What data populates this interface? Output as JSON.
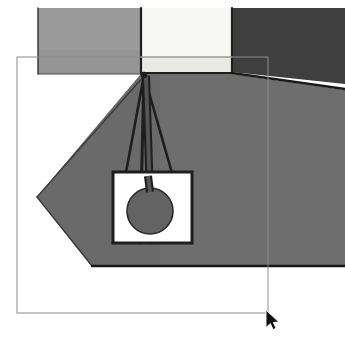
{
  "canvas": {
    "width": 345,
    "height": 338,
    "background": "#ffffff",
    "title": "Pendant lamp photo with rectangular selection"
  },
  "palette": {
    "white": "#ffffff",
    "bright_panel": "#f6f6f4",
    "bright_panel_lower": "#e9e9e6",
    "wall_left": "#9a9a9a",
    "wall_right_dark": "#3f3f3f",
    "ceiling_main": "#6e6e6e",
    "ceiling_shade": "#666666",
    "outline_dark": "#1e1e1e",
    "lamp_disc": "#636363",
    "lamp_disc_edge": "#2a2a2a",
    "selection_stroke": "#8c8c8c",
    "cursor_fill": "#101010",
    "cursor_stroke": "#ffffff"
  },
  "scene": {
    "name": "pendant-lamp-photo",
    "regions": [
      {
        "name": "wall-panel-left",
        "role": "left light-gray wall panel",
        "fill": "#9a9a9a",
        "points": "38,8 141,8 141,74 38,74"
      },
      {
        "name": "wall-panel-left-lower",
        "role": "left wall panel lower band",
        "fill": "#959595",
        "points": "38,50 141,50 141,74 38,74"
      },
      {
        "name": "bright-window-panel",
        "role": "bright white center panel",
        "fill": "#f6f6f4",
        "points": "141,8 232,8 232,57 141,57"
      },
      {
        "name": "bright-window-panel-lower",
        "role": "bright center panel lower strip",
        "fill": "#e9e9e6",
        "points": "141,57 232,57 232,72 141,72"
      },
      {
        "name": "wall-panel-right-dark",
        "role": "right dark wall panel",
        "fill": "#3f3f3f",
        "points": "232,8 345,8 345,84 232,72"
      },
      {
        "name": "ceiling-plane",
        "role": "large mid-gray ceiling plane",
        "fill": "#6e6e6e",
        "points": "141,74 232,74 345,90 345,266 92,266 37,197 141,74"
      },
      {
        "name": "ceiling-left-facet",
        "role": "darker left facet of ceiling",
        "fill": "#6a6a6a",
        "points": "141,74 37,197 92,266 160,266 160,74"
      }
    ],
    "edges": [
      {
        "name": "edge-panel-left-vertical",
        "from": [
          38,
          8
        ],
        "to": [
          38,
          74
        ],
        "stroke": "#2f2f2f",
        "width": 1.4
      },
      {
        "name": "edge-bright-panel-left",
        "from": [
          141,
          8
        ],
        "to": [
          141,
          74
        ],
        "stroke": "#1e1e1e",
        "width": 2.2
      },
      {
        "name": "edge-bright-panel-right",
        "from": [
          232,
          8
        ],
        "to": [
          232,
          73
        ],
        "stroke": "#1e1e1e",
        "width": 2.2
      },
      {
        "name": "edge-bright-panel-bottom",
        "from": [
          141,
          73
        ],
        "to": [
          232,
          73
        ],
        "stroke": "#1e1e1e",
        "width": 2.0
      },
      {
        "name": "edge-bright-panel-midline",
        "from": [
          141,
          57
        ],
        "to": [
          232,
          57
        ],
        "stroke": "#b9b9b5",
        "width": 1.0
      },
      {
        "name": "edge-left-wall-base",
        "from": [
          38,
          74
        ],
        "to": [
          141,
          74
        ],
        "stroke": "#4a4a4a",
        "width": 1.2
      },
      {
        "name": "edge-right-wall-base",
        "from": [
          232,
          73
        ],
        "to": [
          345,
          89
        ],
        "stroke": "#1a1a1a",
        "width": 2.6
      },
      {
        "name": "edge-ceiling-left-diagonal",
        "from": [
          144,
          76
        ],
        "to": [
          37,
          197
        ],
        "stroke": "#3c3c3c",
        "width": 1.4
      },
      {
        "name": "edge-ceiling-bottom-left",
        "from": [
          37,
          197
        ],
        "to": [
          92,
          266
        ],
        "stroke": "#3a3a3a",
        "width": 1.4
      },
      {
        "name": "edge-ceiling-bottom",
        "from": [
          92,
          266
        ],
        "to": [
          345,
          266
        ],
        "stroke": "#181818",
        "width": 2.4
      }
    ],
    "lamp": {
      "name": "pendant-lamp",
      "anchor_point": [
        144,
        75
      ],
      "cords": [
        {
          "name": "lamp-cord-left",
          "from": [
            144,
            75
          ],
          "to": [
            113,
            243
          ],
          "width": 2.6
        },
        {
          "name": "lamp-cord-center-left",
          "from": [
            144,
            75
          ],
          "to": [
            140,
            243
          ],
          "width": 3.0
        },
        {
          "name": "lamp-cord-center-right",
          "from": [
            144,
            75
          ],
          "to": [
            150,
            243
          ],
          "width": 3.0
        },
        {
          "name": "lamp-cord-right",
          "from": [
            144,
            75
          ],
          "to": [
            192,
            243
          ],
          "width": 2.6
        }
      ],
      "stem": {
        "name": "lamp-stem",
        "from": [
          146,
          76
        ],
        "to": [
          150,
          196
        ],
        "width": 6,
        "fill": "#545454"
      },
      "shade_box": {
        "name": "lamp-shade-box",
        "x": 113,
        "y": 172,
        "width": 79,
        "height": 71,
        "fill": "#ffffff",
        "stroke": "#1e1e1e",
        "stroke_width": 3
      },
      "disc": {
        "name": "lamp-disc",
        "cx": 150,
        "cy": 211,
        "r": 23,
        "fill": "#636363",
        "stroke": "#2a2a2a",
        "stroke_width": 1.6
      }
    }
  },
  "overlay": {
    "selection_rect": {
      "name": "selection-rectangle",
      "x": 17,
      "y": 57,
      "width": 251,
      "height": 256,
      "stroke": "#8c8c8c",
      "stroke_width": 1,
      "fill": "none",
      "label": "Selection region"
    },
    "cursor": {
      "name": "mouse-cursor",
      "type": "arrow-pointer",
      "x": 266,
      "y": 310,
      "label": "Mouse pointer"
    }
  }
}
